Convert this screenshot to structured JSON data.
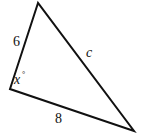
{
  "figure": {
    "type": "triangle",
    "vertices": {
      "top": [
        38,
        3
      ],
      "left": [
        10,
        89
      ],
      "bottom_right": [
        134,
        131
      ]
    },
    "stroke_color": "#111111",
    "labels": {
      "side_left": "6",
      "side_hypotenuse": "c",
      "side_bottom": "8",
      "angle_variable": "x",
      "angle_unit": "°"
    }
  }
}
